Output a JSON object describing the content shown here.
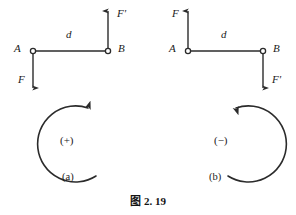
{
  "figure": {
    "caption_prefix": "图",
    "caption_number": "2. 19",
    "caption_full": "图 2. 19",
    "line_color": "#2b2b2b",
    "text_color": "#1a1a1a",
    "background": "#ffffff"
  },
  "panels": [
    {
      "id": "a",
      "sublabel": "(a)",
      "sign_symbol": "(+)",
      "rotation_sense": "counterclockwise",
      "point_a_label": "A",
      "point_b_label": "B",
      "distance_label": "d",
      "force_label": "F",
      "force_prime_label": "F'",
      "force_at_a_direction": "down",
      "force_at_b_direction": "up",
      "geometry": {
        "a_x": 33,
        "a_y": 51,
        "b_x": 108,
        "b_y": 51,
        "force_tip_y": 90,
        "force_prime_tip_y": 8,
        "arc_cx": 104,
        "arc_cy": 141,
        "arc_r": 38
      }
    },
    {
      "id": "b",
      "sublabel": "(b)",
      "sign_symbol": "(−)",
      "rotation_sense": "clockwise",
      "point_a_label": "A",
      "point_b_label": "B",
      "distance_label": "d",
      "force_label": "F",
      "force_prime_label": "F'",
      "force_at_a_direction": "up",
      "force_at_b_direction": "down",
      "geometry": {
        "a_x": 188,
        "a_y": 51,
        "b_x": 263,
        "b_y": 51,
        "force_tip_y": 8,
        "force_prime_tip_y": 90,
        "arc_cx": 220,
        "arc_cy": 141,
        "arc_r": 38
      }
    }
  ]
}
